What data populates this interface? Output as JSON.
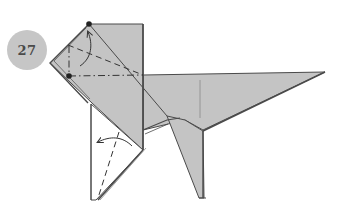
{
  "step": {
    "number": "27"
  },
  "colors": {
    "paper": "#c4c4c4",
    "paper_dark": "#a9a9a9",
    "paper_white": "#ffffff",
    "outline": "#4a4a4a",
    "badge": "#c6c6c6",
    "dot": "#222222"
  },
  "diagram": {
    "markers": [
      {
        "name": "reference-dot-top",
        "x": 89,
        "y": 24
      },
      {
        "name": "reference-dot-left",
        "x": 69,
        "y": 76
      }
    ],
    "fold_lines": [
      {
        "type": "valley",
        "label": "diagonal valley fold on head"
      },
      {
        "type": "mountain",
        "label": "horizontal mountain fold on head"
      },
      {
        "type": "mountain",
        "label": "vertical mountain fold on head"
      },
      {
        "type": "valley",
        "label": "valley fold on front leg"
      }
    ],
    "arrows": [
      {
        "name": "fold-up-arrow",
        "direction": "up"
      },
      {
        "name": "fold-left-arrow",
        "direction": "left"
      }
    ]
  }
}
